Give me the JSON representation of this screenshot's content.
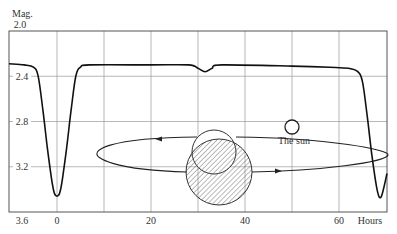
{
  "chart_data": {
    "type": "line",
    "title": "",
    "ylabel": "Mag.",
    "xlabel": "Hours",
    "ylim": [
      2.0,
      3.6
    ],
    "y_inverted": true,
    "xlim": [
      -10,
      70
    ],
    "x_ticks": [
      {
        "value": 0,
        "label": "0"
      },
      {
        "value": 20,
        "label": "20"
      },
      {
        "value": 40,
        "label": "40"
      },
      {
        "value": 60,
        "label": "60"
      }
    ],
    "x_gridlines": [
      0,
      10,
      20,
      30,
      40,
      50,
      60
    ],
    "y_ticks": [
      {
        "value": 2.0,
        "label": "2.0"
      },
      {
        "value": 2.4,
        "label": "2.4"
      },
      {
        "value": 2.8,
        "label": "2.8"
      },
      {
        "value": 3.2,
        "label": "3.2"
      },
      {
        "value": 3.6,
        "label": "3.6"
      }
    ],
    "grid": true,
    "series": [
      {
        "name": "light curve",
        "points": [
          [
            -10,
            2.29
          ],
          [
            -7,
            2.3
          ],
          [
            -5,
            2.32
          ],
          [
            -4,
            2.4
          ],
          [
            -3,
            2.7
          ],
          [
            -2,
            3.05
          ],
          [
            -1,
            3.35
          ],
          [
            -0.5,
            3.44
          ],
          [
            0,
            3.46
          ],
          [
            0.5,
            3.44
          ],
          [
            1,
            3.35
          ],
          [
            2,
            3.05
          ],
          [
            3,
            2.7
          ],
          [
            4,
            2.4
          ],
          [
            5,
            2.32
          ],
          [
            7,
            2.3
          ],
          [
            20,
            2.3
          ],
          [
            28,
            2.3
          ],
          [
            30,
            2.33
          ],
          [
            31.5,
            2.36
          ],
          [
            33,
            2.33
          ],
          [
            35,
            2.3
          ],
          [
            50,
            2.31
          ],
          [
            58,
            2.32
          ],
          [
            62,
            2.33
          ],
          [
            64,
            2.36
          ],
          [
            65,
            2.45
          ],
          [
            66,
            2.75
          ],
          [
            67,
            3.1
          ],
          [
            68,
            3.38
          ],
          [
            68.6,
            3.47
          ],
          [
            69.2,
            3.44
          ],
          [
            70,
            3.26
          ]
        ]
      }
    ],
    "annotations": [
      {
        "text": "The sun",
        "at": [
          50,
          2.6
        ]
      }
    ]
  },
  "diagram": {
    "sun_label": "The sun",
    "labels": {
      "y_unit": "Mag.",
      "x_unit": "Hours"
    }
  }
}
